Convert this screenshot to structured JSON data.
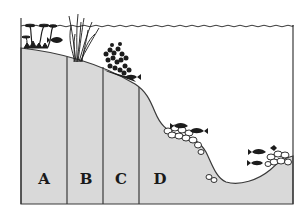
{
  "diagram": {
    "type": "lake cross-section",
    "colors": {
      "ground_fill": "#d9d9d9",
      "outline": "#3a3a3a",
      "vegetation": "#1c1c1c",
      "background": "#ffffff"
    },
    "zones": [
      {
        "id": "A",
        "label": "A",
        "x": 44,
        "y": 179
      },
      {
        "id": "B",
        "label": "B",
        "x": 86,
        "y": 179
      },
      {
        "id": "C",
        "label": "C",
        "x": 121,
        "y": 179
      },
      {
        "id": "D",
        "label": "D",
        "x": 160,
        "y": 179
      }
    ],
    "features": [
      "water-surface",
      "floating-leaf-plants",
      "emergent-reeds",
      "submerged-bushy-plants",
      "rock-pile-slope",
      "rock-pile-right",
      "fish"
    ]
  }
}
